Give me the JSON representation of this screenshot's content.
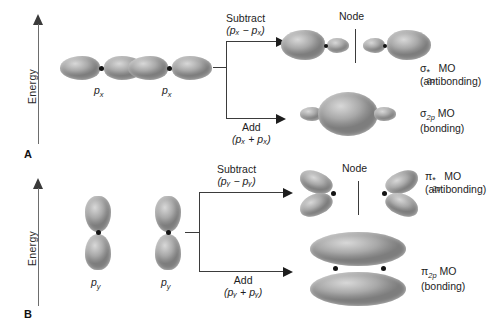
{
  "figure": {
    "type": "diagram",
    "axis_label": "Energy"
  },
  "panels": [
    {
      "letter": "A",
      "orbital_type": "px",
      "atomic_orbitals": [
        {
          "label_base": "p",
          "label_sub": "x"
        },
        {
          "label_base": "p",
          "label_sub": "x"
        }
      ],
      "operations": [
        {
          "name": "Subtract",
          "expression": "(pₓ − pₓ)"
        },
        {
          "name": "Add",
          "expression": "(pₓ + pₓ)"
        }
      ],
      "node_label": "Node",
      "results": [
        {
          "symbol": "σ",
          "superscript": "*",
          "subscript": "2p",
          "suffix": "MO",
          "kind": "(antibonding)"
        },
        {
          "symbol": "σ",
          "superscript": "",
          "subscript": "2p",
          "suffix": "MO",
          "kind": "(bonding)"
        }
      ]
    },
    {
      "letter": "B",
      "orbital_type": "py",
      "atomic_orbitals": [
        {
          "label_base": "p",
          "label_sub": "y"
        },
        {
          "label_base": "p",
          "label_sub": "y"
        }
      ],
      "operations": [
        {
          "name": "Subtract",
          "expression": "(pᵧ − pᵧ)"
        },
        {
          "name": "Add",
          "expression": "(pᵧ + pᵧ)"
        }
      ],
      "node_label": "Node",
      "results": [
        {
          "symbol": "π",
          "superscript": "*",
          "subscript": "2p",
          "suffix": "MO",
          "kind": "(antibonding)"
        },
        {
          "symbol": "π",
          "superscript": "",
          "subscript": "2p",
          "suffix": "MO",
          "kind": "(bonding)"
        }
      ]
    }
  ],
  "colors": {
    "lobe_light": "#d8d8d8",
    "lobe_mid": "#a9a9a9",
    "lobe_dark": "#7d7d7d",
    "line": "#3b3b3b",
    "axis": "#6d6d6d",
    "text": "#1d1d1d",
    "background": "#ffffff"
  }
}
